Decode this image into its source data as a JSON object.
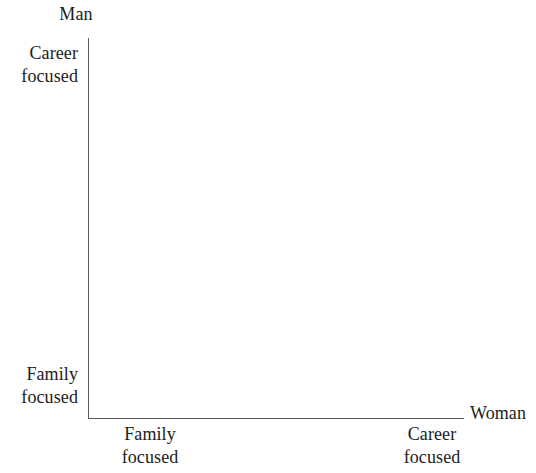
{
  "figure": {
    "background_color": "#ffffff",
    "axis_color": "#585858",
    "text_color": "#1c1c1c"
  },
  "axes": {
    "vertical": {
      "title": "Man",
      "low_label_line1": "Family",
      "low_label_line2": "focused",
      "high_label_line1": "Career",
      "high_label_line2": "focused"
    },
    "horizontal": {
      "title": "Woman",
      "low_label_line1": "Family",
      "low_label_line2": "focused",
      "high_label_line1": "Career",
      "high_label_line2": "focused"
    }
  },
  "chart_data": {
    "type": "scatter",
    "title": "",
    "subtitle": "",
    "xlabel": "Woman",
    "ylabel": "Man",
    "x_tick_labels": [
      "Family focused",
      "Career focused"
    ],
    "y_tick_labels": [
      "Family focused",
      "Career focused"
    ],
    "x_tick_positions": [
      0,
      1
    ],
    "y_tick_positions": [
      0,
      1
    ],
    "xlim": [
      0,
      1
    ],
    "ylim": [
      0,
      1
    ],
    "grid": false,
    "legend": false,
    "legend_position": "none",
    "series": [],
    "annotations": [],
    "note": "Empty two-by-two conceptual framework: axes are drawn with named low and high poles, but no data points, quadrant labels, or plotted marks appear inside the plotting area."
  }
}
